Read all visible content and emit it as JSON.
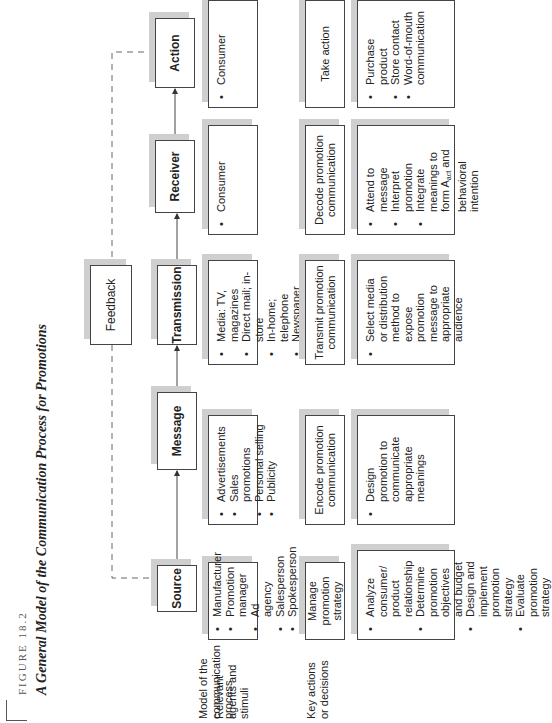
{
  "figure": {
    "label": "FIGURE 18.2",
    "title": "A General Model of the Communication Process for Promotions"
  },
  "row_labels": {
    "model": "Model of the communication process",
    "agents": "Relevant agents and stimuli",
    "actions": "Key actions or decisions"
  },
  "nodes": {
    "source": "Source",
    "message": "Message",
    "transmission": "Transmission",
    "receiver": "Receiver",
    "action": "Action",
    "feedback": "Feedback"
  },
  "agents": {
    "source": [
      "Manufacturer",
      "Promotion manager",
      "Ad agency",
      "Salesperson",
      "Spokesperson"
    ],
    "message": [
      "Advertisements",
      "Sales promotions",
      "Personal selling",
      "Publicity"
    ],
    "transmission": [
      "Media: TV, magazines",
      "Direct mail; in-store",
      "In-home; telephone",
      "Newspaper articles"
    ],
    "receiver": [
      "Consumer"
    ],
    "action": [
      "Consumer"
    ]
  },
  "key_actions": {
    "source": "Manage promotion strategy",
    "message": "Encode promotion communication",
    "transmission": "Transmit promotion communication",
    "receiver": "Decode promotion communication",
    "action": "Take action"
  },
  "decisions": {
    "source": [
      "Analyze consumer/ product relationship",
      "Determine promotion objectives and budget",
      "Design and implement promotion strategy",
      "Evaluate promotion strategy"
    ],
    "message": [
      "Design promotion to communicate appropriate meanings"
    ],
    "transmission": [
      "Select media or distribution method to expose promotion message to appropriate audience"
    ],
    "receiver": [
      "Attend to message",
      "Interpret promotion",
      "Integrate meanings to form A",
      "and behavioral intention"
    ],
    "receiver_subscript": "act",
    "action": [
      "Purchase product",
      "Store contact",
      "Word-of-mouth communication"
    ]
  }
}
